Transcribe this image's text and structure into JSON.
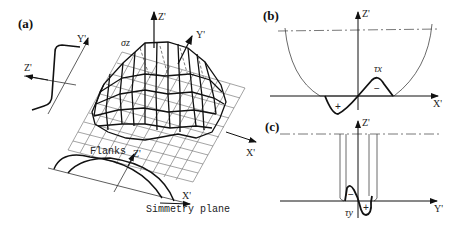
{
  "panels": {
    "a": {
      "label": "(a)",
      "axes": {
        "z": "Z'",
        "y": "Y'",
        "x": "X'",
        "side_z": "Z'",
        "side_y": "Y'",
        "bottom_z": "Z'",
        "bottom_x": "X'"
      },
      "stress_label": "σz",
      "annotations": {
        "flanks": "Flanks",
        "symmetry_plane": "Simmetry plane"
      }
    },
    "b": {
      "label": "(b)",
      "axes": {
        "z": "Z'",
        "x": "X'"
      },
      "stress_label": "τx",
      "signs": {
        "plus": "+",
        "minus": "−"
      }
    },
    "c": {
      "label": "(c)",
      "axes": {
        "z": "Z'",
        "y": "Y'"
      },
      "stress_label": "τy",
      "signs": {
        "plus": "+",
        "minus": "−"
      }
    }
  },
  "colors": {
    "line": "#111111",
    "grid": "#555555",
    "background": "#ffffff"
  }
}
